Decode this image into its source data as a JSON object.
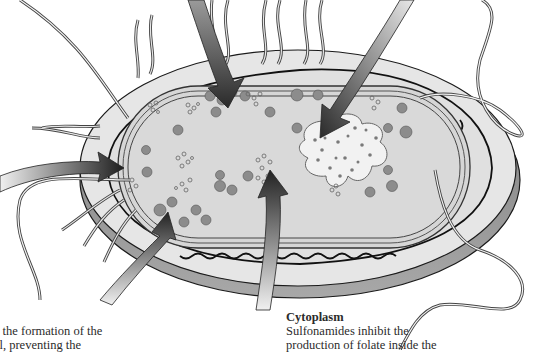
{
  "diagram": {
    "colors": {
      "background": "#ffffff",
      "capsule": "#e4e4e4",
      "capsule_shadow": "#8a8a8a",
      "cytoplasm": "#d8d8d8",
      "outline": "#1a1a1a",
      "granule": "#8c8c8c",
      "arrow_dark": "#2a2a2a",
      "arrow_light": "#e8e8e8"
    },
    "arrows": [
      {
        "id": "arrow-top-left",
        "target": "ribosomes"
      },
      {
        "id": "arrow-top-right",
        "target": "nucleoid-dna"
      },
      {
        "id": "arrow-left",
        "target": "cell-membrane"
      },
      {
        "id": "arrow-bottom-left",
        "target": "cell-wall"
      },
      {
        "id": "arrow-bottom-center",
        "target": "cytoplasm"
      }
    ],
    "labels": {
      "cell_wall": {
        "line1": "t the formation of the",
        "line2": "ll, preventing the"
      },
      "cytoplasm": {
        "title": "Cytoplasm",
        "line1": "Sulfonamides inhibit the",
        "line2": "production of folate inside the"
      }
    }
  }
}
